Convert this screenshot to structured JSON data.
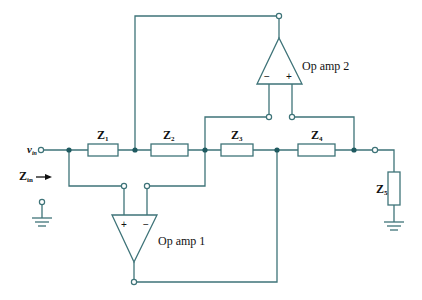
{
  "diagram": {
    "type": "circuit-schematic",
    "input": {
      "voltage_label": "v",
      "voltage_sub": "in",
      "impedance_label": "Z",
      "impedance_sub": "in",
      "arrow": "→"
    },
    "impedances": [
      {
        "id": "Z1",
        "label": "Z",
        "sub": "1"
      },
      {
        "id": "Z2",
        "label": "Z",
        "sub": "2"
      },
      {
        "id": "Z3",
        "label": "Z",
        "sub": "3"
      },
      {
        "id": "Z4",
        "label": "Z",
        "sub": "4"
      },
      {
        "id": "Z5",
        "label": "Z",
        "sub": "5"
      }
    ],
    "op_amps": [
      {
        "id": "opamp1",
        "label": "Op amp 1",
        "plus": "+",
        "minus": "−"
      },
      {
        "id": "opamp2",
        "label": "Op amp 2",
        "plus": "+",
        "minus": "−"
      }
    ],
    "colors": {
      "wire": "#3e7378",
      "node": "#1f5a60",
      "text": "#111111"
    }
  }
}
